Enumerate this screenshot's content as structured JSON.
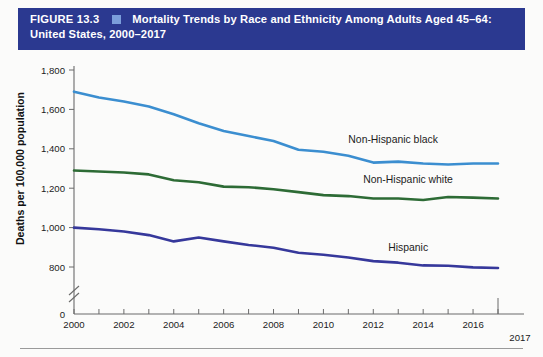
{
  "header": {
    "figure_number": "FIGURE 13.3",
    "bullet_icon": "square-bullet-icon",
    "title_line1": "Mortality Trends by Race and Ethnicity Among Adults Aged 45–64:",
    "title_line2": "United States, 2000–2017",
    "bar_color": "#2b3990",
    "bullet_color": "#7b9edb"
  },
  "chart_data": {
    "type": "line",
    "title": "Mortality Trends by Race and Ethnicity Among Adults Aged 45–64: United States, 2000–2017",
    "xlabel": "",
    "ylabel": "Deaths per 100,000 population",
    "x": [
      2000,
      2001,
      2002,
      2003,
      2004,
      2005,
      2006,
      2007,
      2008,
      2009,
      2010,
      2011,
      2012,
      2013,
      2014,
      2015,
      2016,
      2017
    ],
    "xlim": [
      2000,
      2017
    ],
    "ylim": [
      800,
      1800
    ],
    "y_axis_break": true,
    "y_zero_label": "0",
    "yticks": [
      800,
      1000,
      1200,
      1400,
      1600,
      1800
    ],
    "ytick_labels": [
      "800",
      "1,000",
      "1,200",
      "1,400",
      "1,600",
      "1,800"
    ],
    "xticks": [
      2000,
      2002,
      2004,
      2006,
      2008,
      2010,
      2012,
      2014,
      2016
    ],
    "xtick_labels": [
      "2000",
      "2002",
      "2004",
      "2006",
      "2008",
      "2010",
      "2012",
      "2014",
      "2016"
    ],
    "x_end_label": "2017",
    "x_minor_ticks_every": 1,
    "grid": false,
    "legend_position": "inline-right",
    "series": [
      {
        "name": "Non-Hispanic black",
        "color": "#3b8ed0",
        "label_x": 2011.0,
        "label_y": 1430,
        "values": [
          1690,
          1660,
          1640,
          1615,
          1575,
          1530,
          1490,
          1465,
          1440,
          1395,
          1385,
          1365,
          1330,
          1335,
          1325,
          1320,
          1325,
          1325
        ]
      },
      {
        "name": "Non-Hispanic white",
        "color": "#2d6b35",
        "label_x": 2011.6,
        "label_y": 1225,
        "values": [
          1290,
          1285,
          1280,
          1270,
          1240,
          1230,
          1208,
          1205,
          1195,
          1180,
          1165,
          1160,
          1148,
          1148,
          1140,
          1155,
          1152,
          1148
        ]
      },
      {
        "name": "Hispanic",
        "color": "#36389b",
        "label_x": 2012.6,
        "label_y": 880,
        "values": [
          1000,
          992,
          980,
          962,
          930,
          950,
          930,
          912,
          898,
          872,
          862,
          848,
          830,
          822,
          808,
          806,
          798,
          795
        ]
      }
    ]
  }
}
